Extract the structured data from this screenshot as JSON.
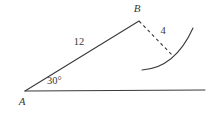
{
  "figure": {
    "type": "geometry-diagram",
    "background_color": "#ffffff",
    "stroke_color": "#3a3a3a",
    "labels": {
      "vertex_a": "A",
      "vertex_b": "B",
      "side_ab_length": "12",
      "dashed_length": "4",
      "angle_at_a": "30°"
    },
    "geometry": {
      "point_a": {
        "x": 25,
        "y": 91
      },
      "point_b": {
        "x": 139,
        "y": 21
      },
      "baseline_end": {
        "x": 205,
        "y": 90
      },
      "dashed_end": {
        "x": 172,
        "y": 55
      },
      "arc_start": {
        "x": 142,
        "y": 70
      },
      "arc_end": {
        "x": 193,
        "y": 28
      }
    },
    "label_positions": {
      "vertex_a": {
        "x": 22,
        "y": 105
      },
      "vertex_b": {
        "x": 137,
        "y": 12
      },
      "side_ab_length": {
        "x": 79,
        "y": 45
      },
      "dashed_length": {
        "x": 163,
        "y": 34
      },
      "angle_at_a": {
        "x": 47,
        "y": 84
      }
    }
  }
}
